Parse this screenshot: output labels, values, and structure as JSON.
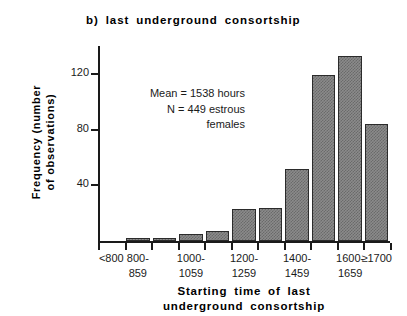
{
  "chart_data": {
    "type": "bar",
    "title": "b) last underground consortship",
    "xlabel_line1": "Starting  time  of  last",
    "xlabel_line2": "underground  consortship",
    "ylabel_line1": "Frequency  (number",
    "ylabel_line2": "of  observations)",
    "categories": [
      "<800",
      "800-859",
      "900-959",
      "1000-1059",
      "1100-1159",
      "1200-1259",
      "1300-1359",
      "1400-1459",
      "1500-1559",
      "1600-1659",
      "≥1700"
    ],
    "values": [
      0,
      2,
      2,
      5,
      7,
      23,
      24,
      52,
      119,
      133,
      84
    ],
    "ylim": [
      0,
      140
    ],
    "yticks": [
      40,
      80,
      120
    ],
    "ytick_labels": [
      "40",
      "80",
      "120"
    ],
    "grid": false,
    "legend": "none",
    "annotations": [
      "Mean = 1538 hours",
      "N = 449 estrous",
      "females"
    ]
  },
  "axis": {
    "y_ticks": [
      {
        "label": "120",
        "value": 120
      },
      {
        "label": "80",
        "value": 80
      },
      {
        "label": "40",
        "value": 40
      }
    ],
    "x_tick_labels": [
      {
        "line1": "<800",
        "line2": ""
      },
      {
        "line1": "800-",
        "line2": "859"
      },
      {
        "line1": "1000-",
        "line2": "1059"
      },
      {
        "line1": "1200-",
        "line2": "1259"
      },
      {
        "line1": "1400-",
        "line2": "1459"
      },
      {
        "line1": "1600-",
        "line2": "1659"
      },
      {
        "line1": "≥1700",
        "line2": ""
      }
    ]
  },
  "colors": {
    "axis": "#1a1a1a",
    "bar_fill": "#8b8b8b",
    "bar_hatch": "#6a6a6a",
    "bar_edge": "#2b2b2b",
    "background": "#ffffff",
    "text": "#1a1a1a"
  }
}
